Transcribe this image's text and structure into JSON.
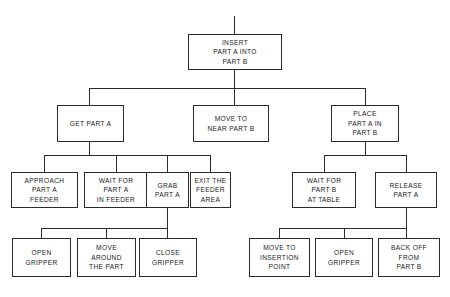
{
  "diagram": {
    "line_color": "#2b2b2b",
    "box_fill": "#ffffff",
    "nodes": {
      "root": {
        "lines": [
          "INSERT",
          "PART A INTO",
          "PART B"
        ]
      },
      "get_part_a": {
        "lines": [
          "GET PART A"
        ]
      },
      "move_to_near_part_b": {
        "lines": [
          "MOVE TO",
          "NEAR PART B"
        ]
      },
      "place_part_a_in_part_b": {
        "lines": [
          "PLACE",
          "PART A IN",
          "PART B"
        ]
      },
      "approach_part_a_feeder": {
        "lines": [
          "APPROACH",
          "PART A",
          "FEEDER"
        ]
      },
      "wait_for_part_a_in_feeder": {
        "lines": [
          "WAIT FOR",
          "PART A",
          "IN FEEDER"
        ]
      },
      "grab_part_a": {
        "lines": [
          "GRAB",
          "PART A"
        ]
      },
      "exit_the_feeder_area": {
        "lines": [
          "EXIT THE",
          "FEEDER",
          "AREA"
        ]
      },
      "wait_for_part_b_at_table": {
        "lines": [
          "WAIT FOR",
          "PART B",
          "AT TABLE"
        ]
      },
      "release_part_a": {
        "lines": [
          "RELEASE",
          "PART A"
        ]
      },
      "open_gripper_left": {
        "lines": [
          "OPEN",
          "GRIPPER"
        ]
      },
      "move_around_the_part": {
        "lines": [
          "MOVE",
          "AROUND",
          "THE PART"
        ]
      },
      "close_gripper": {
        "lines": [
          "CLOSE",
          "GRIPPER"
        ]
      },
      "move_to_insertion_point": {
        "lines": [
          "MOVE TO",
          "INSERTION",
          "POINT"
        ]
      },
      "open_gripper_right": {
        "lines": [
          "OPEN",
          "GRIPPER"
        ]
      },
      "back_off_from_part_b": {
        "lines": [
          "BACK OFF",
          "FROM",
          "PART B"
        ]
      }
    }
  }
}
